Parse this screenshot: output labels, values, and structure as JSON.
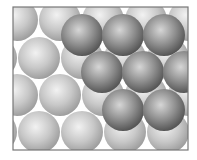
{
  "diagram": {
    "frame": {
      "x": 13,
      "y": 7,
      "width": 175,
      "height": 143,
      "stroke": "#777777"
    },
    "radius": 21,
    "colors": {
      "bottom_layer_light": "#f2f2f2",
      "bottom_layer_mid": "#c8c8c8",
      "bottom_layer_dark": "#9a9a9a",
      "top_layer_light": "#d6d6d6",
      "top_layer_mid": "#8e8e8e",
      "top_layer_dark": "#505050"
    },
    "bottom_layer": [
      [
        17,
        20
      ],
      [
        60,
        20
      ],
      [
        103,
        20
      ],
      [
        146,
        20
      ],
      [
        189,
        20
      ],
      [
        -4,
        58
      ],
      [
        39,
        58
      ],
      [
        82,
        58
      ],
      [
        125,
        58
      ],
      [
        168,
        58
      ],
      [
        211,
        58
      ],
      [
        17,
        95
      ],
      [
        60,
        95
      ],
      [
        103,
        95
      ],
      [
        146,
        95
      ],
      [
        189,
        95
      ],
      [
        -4,
        132
      ],
      [
        39,
        132
      ],
      [
        82,
        132
      ],
      [
        125,
        132
      ],
      [
        168,
        132
      ],
      [
        211,
        132
      ]
    ],
    "top_layer": [
      [
        82,
        35
      ],
      [
        123,
        35
      ],
      [
        164,
        35
      ],
      [
        102,
        72
      ],
      [
        143,
        72
      ],
      [
        184,
        72
      ],
      [
        123,
        110
      ],
      [
        164,
        110
      ]
    ]
  }
}
